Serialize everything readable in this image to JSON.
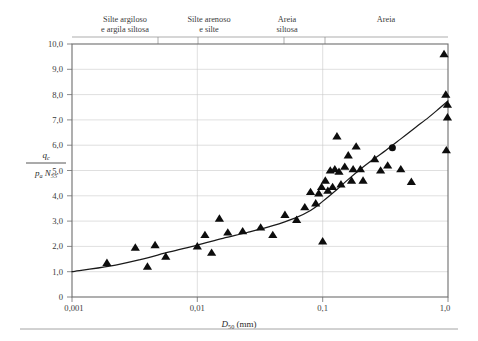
{
  "figure": {
    "name": "qc-over-pa-N55-vs-D50-chart",
    "background_color": "#ffffff",
    "frame_color": "#6d6d6d",
    "grid_color": "#c9c9c9",
    "marker_color": "#0d0d0d",
    "curve_color": "#1a1a1a"
  },
  "category_bands": [
    {
      "label_line1": "Silte argiloso",
      "label_line2": "e argila siltosa"
    },
    {
      "label_line1": "Silte arenoso",
      "label_line2": "e silte"
    },
    {
      "label_line1": "Areia",
      "label_line2": "siltosa"
    },
    {
      "label_line1": "Areia",
      "label_line2": ""
    }
  ],
  "axis_labels": {
    "y_numerator": "q",
    "y_numerator_sub": "c",
    "y_denominator_p": "p",
    "y_denominator_p_sub": "a",
    "y_denominator_n": "N",
    "y_denominator_n_sub": "55",
    "x_symbol": "D",
    "x_symbol_sub": "50",
    "x_units": "(mm)"
  },
  "chart_data": {
    "type": "scatter",
    "title": "",
    "xlabel": "D50 (mm)",
    "ylabel": "qc / (pa N55)",
    "xscale": "log",
    "yscale": "linear",
    "xlim": [
      0.001,
      1.0
    ],
    "ylim": [
      0,
      10
    ],
    "grid": true,
    "legend": "none",
    "x_tick_labels": [
      "0,001",
      "0,01",
      "0,1",
      "1,0"
    ],
    "x_tick_values": [
      0.001,
      0.01,
      0.1,
      1.0
    ],
    "y_tick_labels": [
      "0",
      "1,0",
      "2,0",
      "3,0",
      "4,0",
      "5,0",
      "6,0",
      "7,0",
      "8,0",
      "9,0",
      "10,0"
    ],
    "y_tick_values": [
      0,
      1,
      2,
      3,
      4,
      5,
      6,
      7,
      8,
      9,
      10
    ],
    "category_boundaries_x": [
      0.0035,
      0.0075,
      0.035,
      0.075
    ],
    "series": [
      {
        "name": "Dados de campo",
        "marker": "triangle",
        "points": [
          [
            0.0019,
            1.35
          ],
          [
            0.0032,
            1.95
          ],
          [
            0.004,
            1.2
          ],
          [
            0.0046,
            2.05
          ],
          [
            0.0056,
            1.6
          ],
          [
            0.01,
            2.0
          ],
          [
            0.0115,
            2.45
          ],
          [
            0.013,
            1.75
          ],
          [
            0.015,
            3.1
          ],
          [
            0.0175,
            2.55
          ],
          [
            0.023,
            2.6
          ],
          [
            0.032,
            2.75
          ],
          [
            0.04,
            2.45
          ],
          [
            0.05,
            3.25
          ],
          [
            0.062,
            3.05
          ],
          [
            0.072,
            3.55
          ],
          [
            0.08,
            4.15
          ],
          [
            0.088,
            3.7
          ],
          [
            0.093,
            4.1
          ],
          [
            0.098,
            4.35
          ],
          [
            0.1,
            2.2
          ],
          [
            0.105,
            4.6
          ],
          [
            0.11,
            4.2
          ],
          [
            0.115,
            5.0
          ],
          [
            0.12,
            4.35
          ],
          [
            0.125,
            5.05
          ],
          [
            0.13,
            6.35
          ],
          [
            0.135,
            4.95
          ],
          [
            0.14,
            4.45
          ],
          [
            0.15,
            5.15
          ],
          [
            0.16,
            5.6
          ],
          [
            0.17,
            4.6
          ],
          [
            0.175,
            5.05
          ],
          [
            0.185,
            5.95
          ],
          [
            0.2,
            5.05
          ],
          [
            0.21,
            4.6
          ],
          [
            0.26,
            5.45
          ],
          [
            0.29,
            5.0
          ],
          [
            0.33,
            5.2
          ],
          [
            0.42,
            5.05
          ],
          [
            0.51,
            4.55
          ],
          [
            0.93,
            9.6
          ],
          [
            0.96,
            8.0
          ],
          [
            0.99,
            7.6
          ],
          [
            0.99,
            7.1
          ],
          [
            0.97,
            5.8
          ]
        ]
      },
      {
        "name": "Dados complementares",
        "marker": "circle",
        "points": [
          [
            0.36,
            5.9
          ]
        ]
      }
    ],
    "trend_curve": {
      "name": "Curva de tendencia",
      "points": [
        [
          0.001,
          1.0
        ],
        [
          0.002,
          1.22
        ],
        [
          0.0035,
          1.48
        ],
        [
          0.006,
          1.78
        ],
        [
          0.01,
          2.05
        ],
        [
          0.016,
          2.32
        ],
        [
          0.025,
          2.55
        ],
        [
          0.04,
          2.82
        ],
        [
          0.06,
          3.12
        ],
        [
          0.08,
          3.42
        ],
        [
          0.1,
          3.78
        ],
        [
          0.13,
          4.25
        ],
        [
          0.16,
          4.65
        ],
        [
          0.2,
          5.05
        ],
        [
          0.26,
          5.48
        ],
        [
          0.32,
          5.8
        ],
        [
          0.42,
          6.25
        ],
        [
          0.55,
          6.7
        ],
        [
          0.7,
          7.1
        ],
        [
          0.85,
          7.45
        ],
        [
          1.0,
          7.75
        ]
      ]
    }
  }
}
